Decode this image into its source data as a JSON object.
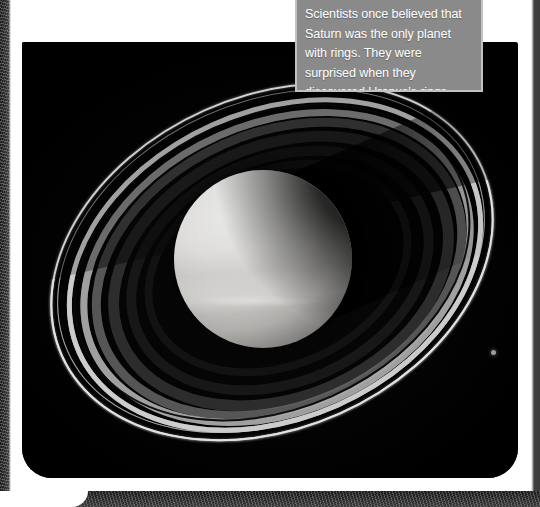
{
  "page": {
    "background_color": "#ffffff",
    "width": 540,
    "height": 507
  },
  "photo": {
    "alt_label": "saturn-with-rings-photograph",
    "background_color": "#010101"
  },
  "caption": {
    "text": "Scientists once believed that Saturn was the only planet with rings. They were surprised when they discovered Uranus's rings.",
    "background_color": "#8a8a8a",
    "border_color": "#c2c2c2",
    "text_color": "#ffffff"
  },
  "subjects": {
    "planet_label": "saturn-planet",
    "rings_label": "saturn-ring-system",
    "moon_label": "saturn-moon"
  },
  "edges": {
    "left_label": "page-edge-left",
    "right_label": "page-edge-right",
    "bottom_label": "page-edge-bottom",
    "color": "#1b1b1b"
  }
}
